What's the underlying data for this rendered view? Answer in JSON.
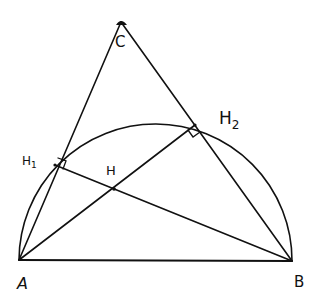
{
  "diagram": {
    "type": "geometry",
    "stroke_color": "#111111",
    "background": "#ffffff",
    "points": {
      "A": {
        "label": "A",
        "x": 19,
        "y": 260
      },
      "B": {
        "label": "B",
        "x": 292,
        "y": 261
      },
      "C": {
        "label": "C",
        "x": 121,
        "y": 22
      },
      "H1": {
        "label": "H",
        "sub": "1",
        "x": 55,
        "y": 165
      },
      "H2": {
        "label": "H",
        "sub": "2",
        "x": 195,
        "y": 125
      },
      "H": {
        "label": "H",
        "x": 114,
        "y": 189
      }
    },
    "segments": [
      {
        "from": "A",
        "to": "B"
      },
      {
        "from": "A",
        "to": "C"
      },
      {
        "from": "B",
        "to": "C"
      },
      {
        "from": "A",
        "to": "H2"
      },
      {
        "from": "B",
        "to": "H1"
      }
    ],
    "arc": {
      "type": "semicircle",
      "diameter": [
        "A",
        "B"
      ]
    },
    "right_angles": [
      "H1",
      "H2"
    ]
  }
}
